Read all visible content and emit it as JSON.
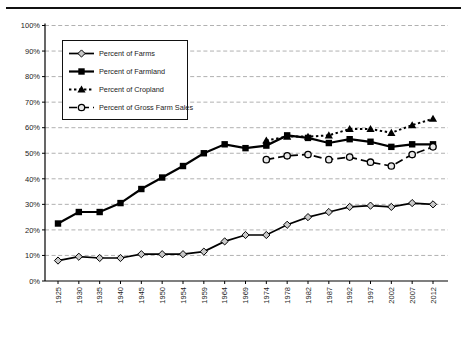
{
  "chart_data": {
    "type": "line",
    "title": "",
    "xlabel": "",
    "ylabel": "",
    "ylim": [
      0,
      100
    ],
    "grid": "horizontal-dashed",
    "legend_position": "top-left-inside",
    "y_ticks": [
      "0%",
      "10%",
      "20%",
      "30%",
      "40%",
      "50%",
      "60%",
      "70%",
      "80%",
      "90%",
      "100%"
    ],
    "categories": [
      "1925",
      "1930",
      "1935",
      "1940",
      "1945",
      "1950",
      "1954",
      "1959",
      "1964",
      "1969",
      "1974",
      "1978",
      "1982",
      "1987",
      "1992",
      "1997",
      "2002",
      "2007",
      "2012"
    ],
    "series": [
      {
        "name": "Percent of Farms",
        "marker": "diamond",
        "line": "solid",
        "values": [
          8,
          9.5,
          9,
          9,
          10.5,
          10.5,
          10.5,
          11.5,
          15.5,
          18,
          18,
          22,
          25,
          27,
          29,
          29.5,
          29,
          30.5,
          30
        ]
      },
      {
        "name": "Percent of Farmland",
        "marker": "square",
        "line": "solid",
        "values": [
          22.5,
          27,
          27,
          30.5,
          36,
          40.5,
          45,
          50,
          53.5,
          52,
          53,
          57,
          56,
          54,
          55.5,
          54.5,
          52.5,
          53.5,
          53.5
        ]
      },
      {
        "name": "Percent of Cropland",
        "marker": "triangle",
        "line": "dotted",
        "values": [
          null,
          null,
          null,
          null,
          null,
          null,
          null,
          null,
          null,
          null,
          55,
          56.5,
          56.5,
          57,
          59.5,
          59.5,
          58,
          61,
          63.5
        ]
      },
      {
        "name": "Percent of Gross Farm Sales",
        "marker": "circle",
        "line": "dashed",
        "values": [
          null,
          null,
          null,
          null,
          null,
          null,
          null,
          null,
          null,
          null,
          47.5,
          49,
          49.5,
          47.5,
          48.5,
          46.5,
          45,
          49.5,
          52.5
        ]
      }
    ],
    "colors": {
      "line": "#000000",
      "grid": "#a8a8a8",
      "diamond_fill": "#c9c9c9",
      "circle_fill": "#e8e8e8"
    }
  }
}
